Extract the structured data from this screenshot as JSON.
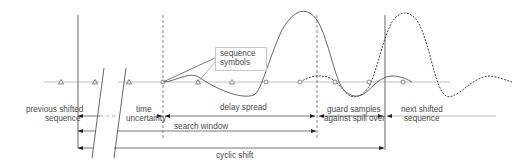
{
  "diagram": {
    "type": "timing-diagram",
    "callout": {
      "line1": "sequence",
      "line2": "symbols"
    },
    "labels": {
      "previous_shifted_1": "previous shifted",
      "previous_shifted_2": "sequence",
      "time_uncertainty_1": "time",
      "time_uncertainty_2": "uncertainty",
      "delay_spread": "delay spread",
      "guard_samples_1": "guard samples",
      "guard_samples_2": "against spill over",
      "next_shifted_1": "next shifted",
      "next_shifted_2": "sequence",
      "search_window": "search window",
      "cyclic_shift": "cyclic shift"
    },
    "markers": {
      "symbol_positions_x": [
        61,
        95,
        129,
        163,
        198,
        232,
        266,
        300,
        335,
        369,
        403,
        437
      ],
      "baseline_y": 82
    },
    "colors": {
      "line": "#555555",
      "light_line": "#aaaaaa",
      "text": "#4a4a4a"
    }
  }
}
